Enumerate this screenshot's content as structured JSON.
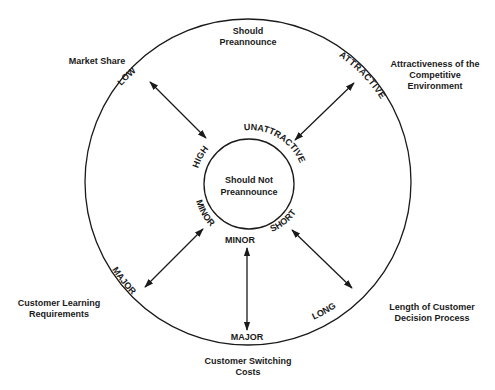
{
  "diagram": {
    "outer_label": "Should Preannounce",
    "outer_label_lines": [
      "Should",
      "Preannounce"
    ],
    "inner_label_lines": [
      "Should Not",
      "Preannounce"
    ],
    "factors": [
      {
        "name": "Market Share",
        "lines": [
          "Market Share"
        ],
        "outer_end": "LOW",
        "inner_end": "HIGH"
      },
      {
        "name": "Attractiveness of the Competitive Environment",
        "lines": [
          "Attractiveness of the",
          "Competitive",
          "Environment"
        ],
        "outer_end": "ATTRACTIVE",
        "inner_end": "UNATTRACTIVE"
      },
      {
        "name": "Length of Customer Decision Process",
        "lines": [
          "Length of Customer",
          "Decision Process"
        ],
        "outer_end": "LONG",
        "inner_end": "SHORT"
      },
      {
        "name": "Customer Switching Costs",
        "lines": [
          "Customer Switching",
          "Costs"
        ],
        "outer_end": "MAJOR",
        "inner_end": "MINOR"
      },
      {
        "name": "Customer Learning Requirements",
        "lines": [
          "Customer Learning",
          "Requirements"
        ],
        "outer_end": "MAJOR",
        "inner_end": "MINOR"
      }
    ]
  }
}
